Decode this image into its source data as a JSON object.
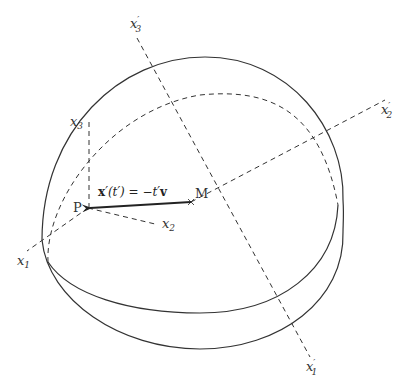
{
  "diagram": {
    "points": {
      "M": {
        "label": "M",
        "x": 191,
        "y": 202
      },
      "P": {
        "label": "P",
        "x": 88,
        "y": 208
      }
    },
    "vector_label": "x′(t′) = −t′v",
    "vector_label_parts": {
      "bold_x": "x",
      "prime_arg": "′(t′) = −t′",
      "bold_v": "v"
    },
    "axes_labels": {
      "x1": {
        "base": "x",
        "sub": "1",
        "prime": ""
      },
      "x2": {
        "base": "x",
        "sub": "2",
        "prime": ""
      },
      "x3": {
        "base": "x",
        "sub": "3",
        "prime": ""
      },
      "x1p": {
        "base": "x",
        "sub": "1",
        "prime": "′"
      },
      "x2p": {
        "base": "x",
        "sub": "2",
        "prime": "′"
      },
      "x3p": {
        "base": "x",
        "sub": "3",
        "prime": "′"
      }
    },
    "colors": {
      "stroke": "#333333",
      "background": "#ffffff"
    }
  }
}
